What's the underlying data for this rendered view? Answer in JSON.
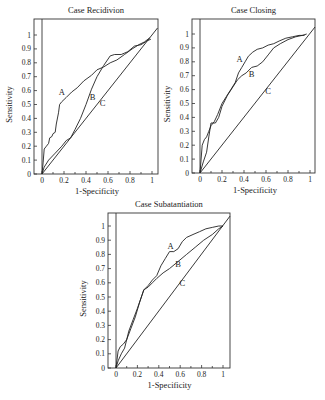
{
  "chart_data": [
    {
      "type": "line",
      "title": "Case Recidivion",
      "xlabel": "1-Specificity",
      "ylabel": "Sensitivity",
      "xlim": [
        0,
        1.05
      ],
      "ylim": [
        0,
        1.05
      ],
      "xticks": [
        "0",
        "0.2",
        "0.4",
        "0.6",
        "0.8",
        "1"
      ],
      "yticks": [
        "0",
        "0.1",
        "0.2",
        "0.3",
        "0.4",
        "0.5",
        "0.6",
        "0.7",
        "0.8",
        "0.9",
        "1"
      ],
      "grid": false,
      "layout": {
        "box": [
          34,
          19,
          158,
          174
        ],
        "x0": 42,
        "x1": 152,
        "y0": 174,
        "y1": 35
      },
      "series": [
        {
          "name": "A",
          "label_pos": [
            0.18,
            0.57
          ],
          "x": [
            0,
            0.01,
            0.02,
            0.04,
            0.06,
            0.07,
            0.09,
            0.1,
            0.12,
            0.13,
            0.15,
            0.16,
            0.18,
            0.22,
            0.27,
            0.32,
            0.38,
            0.45,
            0.5,
            0.56,
            0.62,
            0.68,
            0.75,
            0.82,
            0.88,
            0.93,
            0.98
          ],
          "y": [
            0,
            0.08,
            0.18,
            0.2,
            0.22,
            0.26,
            0.27,
            0.29,
            0.3,
            0.36,
            0.44,
            0.5,
            0.52,
            0.55,
            0.59,
            0.62,
            0.67,
            0.71,
            0.75,
            0.77,
            0.8,
            0.82,
            0.86,
            0.9,
            0.93,
            0.95,
            0.98
          ]
        },
        {
          "name": "B",
          "label_pos": [
            0.46,
            0.53
          ],
          "x": [
            0,
            0.02,
            0.06,
            0.12,
            0.18,
            0.22,
            0.26,
            0.3,
            0.35,
            0.4,
            0.45,
            0.5,
            0.56,
            0.62,
            0.66,
            0.72,
            0.78,
            0.84,
            0.9,
            0.96,
            0.99
          ],
          "y": [
            0,
            0.05,
            0.1,
            0.15,
            0.2,
            0.24,
            0.26,
            0.32,
            0.4,
            0.5,
            0.61,
            0.7,
            0.78,
            0.85,
            0.86,
            0.86,
            0.88,
            0.92,
            0.93,
            0.96,
            0.97
          ]
        },
        {
          "name": "C",
          "label_pos": [
            0.55,
            0.49
          ],
          "x": [
            0,
            1.05
          ],
          "y": [
            0,
            1.05
          ]
        }
      ]
    },
    {
      "type": "line",
      "title": "Case Closing",
      "xlabel": "1-Specificity",
      "ylabel": "Sensitivity",
      "xlim": [
        0,
        1.05
      ],
      "ylim": [
        0,
        1.05
      ],
      "xticks": [
        "0",
        "0.2",
        "0.4",
        "0.6",
        "0.8",
        "1"
      ],
      "yticks": [
        "0",
        "0.1",
        "0.2",
        "0.3",
        "0.4",
        "0.5",
        "0.6",
        "0.7",
        "0.8",
        "0.9",
        "1"
      ],
      "grid": false,
      "layout": {
        "box": [
          192,
          19,
          315,
          173
        ],
        "x0": 200,
        "x1": 310,
        "y0": 173,
        "y1": 34
      },
      "series": [
        {
          "name": "A",
          "label_pos": [
            0.36,
            0.8
          ],
          "x": [
            0,
            0.02,
            0.04,
            0.06,
            0.08,
            0.1,
            0.13,
            0.16,
            0.2,
            0.24,
            0.28,
            0.32,
            0.35,
            0.38,
            0.41,
            0.44,
            0.48,
            0.52,
            0.57,
            0.62,
            0.67,
            0.72,
            0.78,
            0.84,
            0.9,
            0.95
          ],
          "y": [
            0,
            0.2,
            0.24,
            0.26,
            0.3,
            0.34,
            0.37,
            0.42,
            0.5,
            0.55,
            0.6,
            0.65,
            0.72,
            0.76,
            0.8,
            0.84,
            0.87,
            0.89,
            0.9,
            0.92,
            0.93,
            0.95,
            0.97,
            0.98,
            0.99,
            0.99
          ]
        },
        {
          "name": "B",
          "label_pos": [
            0.47,
            0.69
          ],
          "x": [
            0,
            0.03,
            0.06,
            0.08,
            0.1,
            0.14,
            0.17,
            0.2,
            0.25,
            0.3,
            0.34,
            0.38,
            0.42,
            0.47,
            0.52,
            0.57,
            0.62,
            0.67,
            0.73,
            0.8,
            0.87,
            0.93,
            0.97
          ],
          "y": [
            0,
            0.08,
            0.15,
            0.26,
            0.36,
            0.36,
            0.4,
            0.48,
            0.56,
            0.62,
            0.67,
            0.7,
            0.72,
            0.76,
            0.77,
            0.8,
            0.85,
            0.9,
            0.93,
            0.96,
            0.98,
            0.99,
            1.0
          ]
        },
        {
          "name": "C",
          "label_pos": [
            0.62,
            0.57
          ],
          "x": [
            0,
            1.05
          ],
          "y": [
            0,
            1.05
          ]
        }
      ]
    },
    {
      "type": "line",
      "title": "Case Subatantiation",
      "xlabel": "1-Specificity",
      "ylabel": "Sensitivity",
      "xlim": [
        0,
        1.05
      ],
      "ylim": [
        0,
        1.05
      ],
      "xticks": [
        "0",
        "0.2",
        "0.4",
        "0.6",
        "0.8",
        "1"
      ],
      "yticks": [
        "0",
        "0.1",
        "0.2",
        "0.3",
        "0.4",
        "0.5",
        "0.6",
        "0.7",
        "0.8",
        "0.9",
        "1"
      ],
      "grid": false,
      "layout": {
        "box": [
          108,
          213,
          230,
          368
        ],
        "x0": 116,
        "x1": 223,
        "y0": 368,
        "y1": 226
      },
      "series": [
        {
          "name": "A",
          "label_pos": [
            0.51,
            0.84
          ],
          "x": [
            0,
            0.02,
            0.04,
            0.07,
            0.1,
            0.14,
            0.18,
            0.22,
            0.26,
            0.3,
            0.34,
            0.38,
            0.42,
            0.46,
            0.5,
            0.54,
            0.58,
            0.62,
            0.66,
            0.72,
            0.78,
            0.84,
            0.9,
            0.96,
            1.0
          ],
          "y": [
            0,
            0.12,
            0.15,
            0.17,
            0.2,
            0.28,
            0.36,
            0.46,
            0.55,
            0.58,
            0.62,
            0.65,
            0.72,
            0.77,
            0.82,
            0.82,
            0.84,
            0.89,
            0.92,
            0.94,
            0.96,
            0.98,
            0.99,
            1.0,
            1.0
          ]
        },
        {
          "name": "B",
          "label_pos": [
            0.58,
            0.71
          ],
          "x": [
            0,
            0.02,
            0.05,
            0.08,
            0.12,
            0.16,
            0.2,
            0.26,
            0.3,
            0.34,
            0.38,
            0.44,
            0.5,
            0.58,
            0.66,
            0.74,
            0.82,
            0.9,
            0.96,
            1.0
          ],
          "y": [
            0,
            0.05,
            0.1,
            0.14,
            0.26,
            0.34,
            0.42,
            0.55,
            0.57,
            0.6,
            0.63,
            0.67,
            0.7,
            0.75,
            0.8,
            0.85,
            0.9,
            0.94,
            0.98,
            1.0
          ]
        },
        {
          "name": "C",
          "label_pos": [
            0.62,
            0.58
          ],
          "x": [
            0,
            1.07
          ],
          "y": [
            0,
            1.07
          ]
        }
      ]
    }
  ]
}
